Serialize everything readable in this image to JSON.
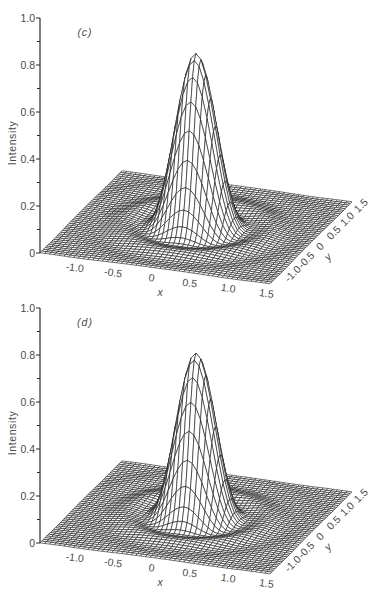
{
  "figure": {
    "panel_count": 2
  },
  "chart_data": [
    {
      "type": "surface",
      "panel_label": "(c)",
      "title": "",
      "xlabel": "x",
      "ylabel": "y",
      "zlabel": "Intensity",
      "xlim": [
        -1.5,
        1.5
      ],
      "ylim": [
        -1.5,
        1.5
      ],
      "zlim": [
        0,
        1.0
      ],
      "x_ticks": [
        -1.0,
        -0.5,
        0,
        0.5,
        1.0,
        1.5
      ],
      "x_tick_labels": [
        "-1.0",
        "-0.5",
        "0",
        "0.5",
        "1.0",
        "1.5"
      ],
      "y_ticks": [
        -1.0,
        -0.5,
        0,
        0.5,
        1.0,
        1.5
      ],
      "y_tick_labels": [
        "-1.0",
        "-0.5",
        "0",
        "0.5",
        "1.0",
        "1.5"
      ],
      "z_ticks": [
        0,
        0.2,
        0.4,
        0.6,
        0.8,
        1.0
      ],
      "z_tick_labels": [
        "0",
        "0.2",
        "0.4",
        "0.6",
        "0.8",
        "1.0"
      ],
      "z_minor_ticks": [
        0.1,
        0.3,
        0.5,
        0.7,
        0.9
      ],
      "surface": {
        "model": "airy",
        "center": [
          0,
          0
        ],
        "peak_intensity": 0.74,
        "first_zero_radius": 0.68,
        "first_ring_radius": 0.91,
        "grid_points_per_axis": 49
      },
      "grid": false,
      "legend": "none"
    },
    {
      "type": "surface",
      "panel_label": "(d)",
      "title": "",
      "xlabel": "x",
      "ylabel": "y",
      "zlabel": "Intensity",
      "xlim": [
        -1.5,
        1.5
      ],
      "ylim": [
        -1.5,
        1.5
      ],
      "zlim": [
        0,
        1.0
      ],
      "x_ticks": [
        -1.0,
        -0.5,
        0,
        0.5,
        1.0,
        1.5
      ],
      "x_tick_labels": [
        "-1.0",
        "-0.5",
        "0",
        "0.5",
        "1.0",
        "1.5"
      ],
      "y_ticks": [
        -1.0,
        -0.5,
        0,
        0.5,
        1.0,
        1.5
      ],
      "y_tick_labels": [
        "-1.0",
        "-0.5",
        "0",
        "0.5",
        "1.0",
        "1.5"
      ],
      "z_ticks": [
        0,
        0.2,
        0.4,
        0.6,
        0.8,
        1.0
      ],
      "z_tick_labels": [
        "0",
        "0.2",
        "0.4",
        "0.6",
        "0.8",
        "1.0"
      ],
      "z_minor_ticks": [
        0.1,
        0.3,
        0.5,
        0.7,
        0.9
      ],
      "surface": {
        "model": "airy",
        "center": [
          0,
          0
        ],
        "peak_intensity": 0.7,
        "first_zero_radius": 0.65,
        "first_ring_radius": 0.87,
        "grid_points_per_axis": 49
      },
      "grid": false,
      "legend": "none"
    }
  ]
}
